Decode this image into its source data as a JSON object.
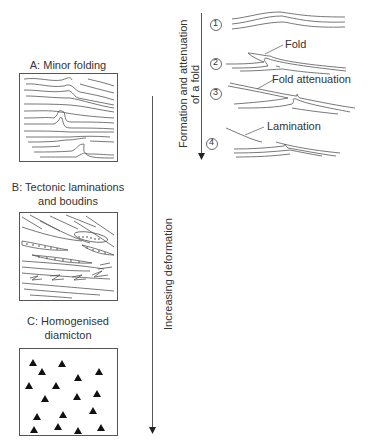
{
  "panels": {
    "a": {
      "title": "A: Minor folding"
    },
    "b": {
      "title_line1": "B: Tectonic laminations",
      "title_line2": "and boudins"
    },
    "c": {
      "title_line1": "C: Homogenised",
      "title_line2": "diamicton"
    }
  },
  "main_axis": {
    "label": "Increasing deformation",
    "direction": "down"
  },
  "fold_sequence": {
    "axis_label_line1": "Formation and attenuation",
    "axis_label_line2": "of a fold",
    "stages": [
      {
        "number": "1",
        "glyph": "①",
        "annotation": ""
      },
      {
        "number": "2",
        "glyph": "②",
        "annotation": "Fold"
      },
      {
        "number": "3",
        "glyph": "③",
        "annotation": "Fold attenuation"
      },
      {
        "number": "4",
        "glyph": "④",
        "annotation": "Lamination"
      }
    ]
  },
  "colors": {
    "line": "#555555",
    "text": "#333333",
    "clast": "#111111",
    "background": "#ffffff"
  }
}
